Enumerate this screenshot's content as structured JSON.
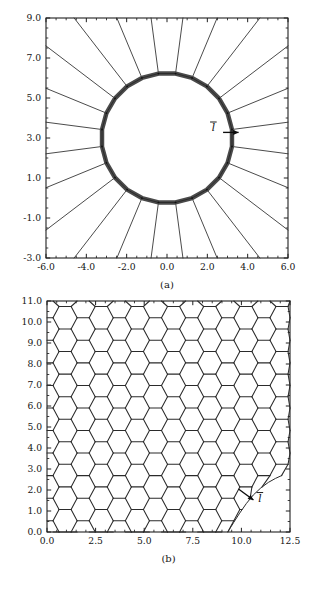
{
  "figure": {
    "caption_a": "(a)",
    "caption_b": "(b)",
    "background_color": "#ffffff",
    "line_color": "#2b2b2b",
    "axis_color": "#1f1f1f"
  },
  "chart_data": [
    {
      "id": "panel-a",
      "type": "line",
      "title": "",
      "subtitle": "",
      "caption": "(a)",
      "xlabel": "",
      "ylabel": "",
      "xlim": [
        -6.0,
        6.0
      ],
      "ylim": [
        -3.0,
        9.0
      ],
      "xticks": [
        -6.0,
        -4.0,
        -2.0,
        0.0,
        2.0,
        4.0,
        6.0
      ],
      "yticks": [
        -3.0,
        -1.0,
        1.0,
        3.0,
        5.0,
        7.0,
        9.0
      ],
      "xtick_labels": [
        "-6.0",
        "-4.0",
        "-2.0",
        "0.0",
        "2.0",
        "4.0",
        "6.0"
      ],
      "ytick_labels": [
        "-3.0",
        "-1.0",
        "1.0",
        "3.0",
        "5.0",
        "7.0",
        "9.0"
      ],
      "xminor_per_major": 4,
      "yminor_per_major": 4,
      "grid": false,
      "legend": false,
      "description": "Radial mesh of straight spokes emanating from a thick circular inner boundary outward to the rectangular domain frame.",
      "geometry": {
        "circle_center": [
          0.0,
          3.0
        ],
        "circle_radius": 3.25,
        "circle_segments": 24,
        "circle_stroke_width_units": 0.22,
        "spoke_count": 24
      },
      "annotations": [
        {
          "text": "l",
          "overbar": true,
          "label_position": [
            2.3,
            3.35
          ],
          "arrow_from": [
            2.78,
            3.28
          ],
          "arrow_to": [
            3.55,
            3.28
          ],
          "arrow_direction": "right"
        }
      ]
    },
    {
      "id": "panel-b",
      "type": "line",
      "title": "",
      "subtitle": "",
      "caption": "(b)",
      "xlabel": "",
      "ylabel": "",
      "xlim": [
        0.0,
        12.5
      ],
      "ylim": [
        0.0,
        11.0
      ],
      "xticks": [
        0.0,
        2.5,
        5.0,
        7.5,
        10.0,
        12.5
      ],
      "yticks": [
        0.0,
        1.0,
        2.0,
        3.0,
        4.0,
        5.0,
        6.0,
        7.0,
        8.0,
        9.0,
        10.0,
        11.0
      ],
      "xtick_labels": [
        "0.0",
        "2.5",
        "5.0",
        "7.5",
        "10.0",
        "12.5"
      ],
      "ytick_labels": [
        "0.0",
        "1.0",
        "2.0",
        "3.0",
        "4.0",
        "5.0",
        "6.0",
        "7.0",
        "8.0",
        "9.0",
        "10.0",
        "11.0"
      ],
      "xminor_per_major": 5,
      "yminor_per_major": 2,
      "grid": false,
      "legend": false,
      "description": "Hexagonal honeycomb mesh filling the domain, truncated on the right by a curved free boundary that sweeps from the bottom edge near x=9.3 up to the right region near y=2.7.",
      "geometry": {
        "hex_orientation": "flat-top",
        "hex_circumradius": 0.62,
        "columns": 11,
        "rows": 12,
        "boundary_curve_points": [
          [
            9.3,
            0.0
          ],
          [
            9.9,
            0.9
          ],
          [
            10.6,
            1.8
          ],
          [
            11.4,
            2.4
          ],
          [
            12.1,
            2.7
          ]
        ]
      },
      "annotations": [
        {
          "text": "l",
          "overbar": true,
          "label_position": [
            10.95,
            1.45
          ],
          "arrow_from": [
            9.85,
            2.05
          ],
          "arrow_to": [
            10.62,
            1.52
          ],
          "arrow_direction": "down-right"
        }
      ]
    }
  ]
}
